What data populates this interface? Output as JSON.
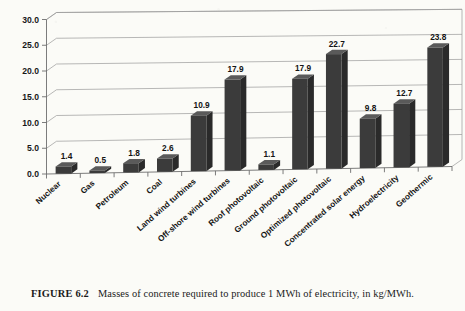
{
  "caption": {
    "figure_number": "FIGURE 6.2",
    "text": "Masses of concrete required to produce 1 MWh of electricity, in kg/MWh."
  },
  "chart_data": {
    "type": "bar",
    "title": "",
    "subtitle": "",
    "xlabel": "",
    "ylabel": "",
    "ylim": [
      0,
      30
    ],
    "ytick_values": [
      0,
      5,
      10,
      15,
      20,
      25,
      30
    ],
    "ytick_labels": [
      "0.0",
      "5.0",
      "10.0",
      "15.0",
      "20.0",
      "25.0",
      "30.0"
    ],
    "grid": true,
    "grid_axis": "y",
    "legend": false,
    "legend_position": "none",
    "style": "3d-perspective-column",
    "data_labels": true,
    "units": "kg/MWh",
    "bar_color": "#3b3b3b",
    "categories": [
      "Nuclear",
      "Gas",
      "Petroleum",
      "Coal",
      "Land wind turbines",
      "Off-shore wind turbines",
      "Roof photovoltaic",
      "Ground photovoltaic",
      "Optimized photovoltaic",
      "Concentrated solar energy",
      "Hydroelectricity",
      "Geothermic"
    ],
    "values": [
      1.4,
      0.5,
      1.8,
      2.6,
      10.9,
      17.9,
      1.1,
      17.9,
      22.7,
      9.8,
      12.7,
      23.8
    ],
    "value_labels": [
      "1.4",
      "0.5",
      "1.8",
      "2.6",
      "10.9",
      "17.9",
      "1.1",
      "17.9",
      "22.7",
      "9.8",
      "12.7",
      "23.8"
    ]
  }
}
